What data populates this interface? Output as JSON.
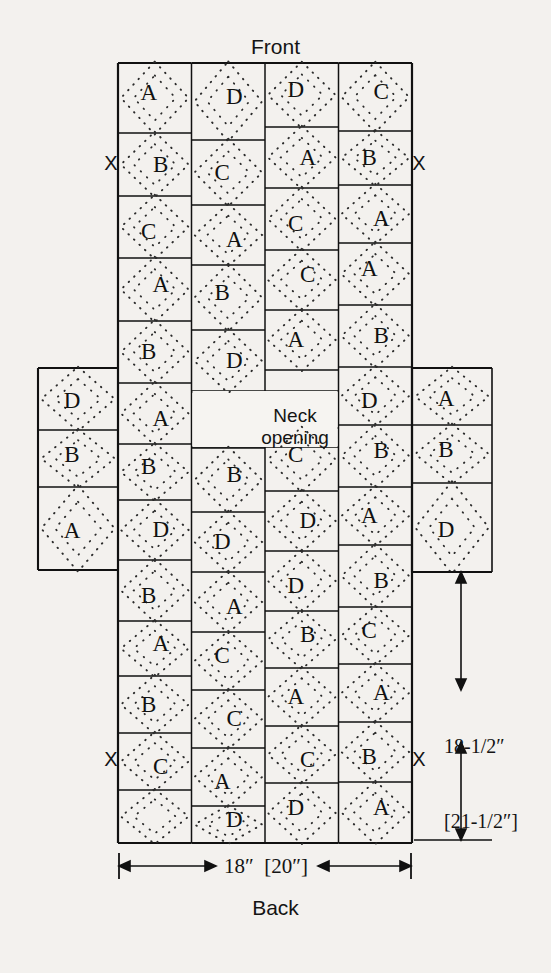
{
  "page": {
    "background_color": "#f3f1ee",
    "ink_color": "#111111"
  },
  "labels": {
    "front": "Front",
    "back": "Back",
    "neck_line1": "Neck",
    "neck_line2": "opening",
    "x_marker": "X"
  },
  "dimensions": {
    "width_label": "18″  [20″]",
    "height_line1": "18-1/2″",
    "height_line2": "[21-1/2″]"
  },
  "motifs": {
    "legend": [
      "A",
      "B",
      "C",
      "D"
    ],
    "description": "dotted diamond argyle block"
  },
  "body_grid": {
    "columns": 4,
    "column_blocks": [
      {
        "column": 1,
        "letters": [
          "A",
          "B",
          "C",
          "A",
          "B",
          "A",
          "B",
          "D",
          "B",
          "A",
          "B",
          "C"
        ]
      },
      {
        "column": 2,
        "letters": [
          "D",
          "C",
          "A",
          "B",
          "D",
          "A",
          "B",
          "D",
          "A",
          "C",
          "C",
          "A",
          "D"
        ]
      },
      {
        "column": 3,
        "letters": [
          "D",
          "A",
          "C",
          "C",
          "A",
          "C",
          "D",
          "D",
          "B",
          "A",
          "C",
          "D"
        ]
      },
      {
        "column": 4,
        "letters": [
          "C",
          "B",
          "A",
          "A",
          "B",
          "D",
          "B",
          "A",
          "B",
          "C",
          "A",
          "B",
          "A"
        ]
      }
    ]
  },
  "sleeves": {
    "left": {
      "letters": [
        "D",
        "B",
        "A"
      ]
    },
    "right": {
      "letters": [
        "A",
        "B",
        "D"
      ]
    }
  },
  "x_markers": {
    "count": 4,
    "positions": [
      "top-left",
      "top-right",
      "bottom-left",
      "bottom-right"
    ]
  }
}
